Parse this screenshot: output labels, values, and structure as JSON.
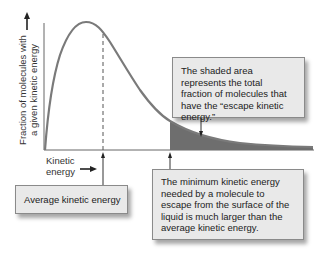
{
  "diagram": {
    "y_axis_label_line1": "Fraction of molecules with",
    "y_axis_label_line2": "a given kinetic energy",
    "x_axis_label_line1": "Kinetic",
    "x_axis_label_line2": "energy",
    "callouts": {
      "shaded_area": "The shaded area represents the total fraction of molecules that have the “escape kinetic energy.”",
      "minimum_energy": "The minimum kinetic energy needed by a molecule to escape from the surface of the liquid is much larger than the average kinetic energy.",
      "average_energy": "Average kinetic energy"
    },
    "colors": {
      "curve": "#7a7a7a",
      "shaded_area": "#6e6e6e",
      "box_fill": "#e9e9e9",
      "box_border": "#8a8a8a"
    }
  }
}
